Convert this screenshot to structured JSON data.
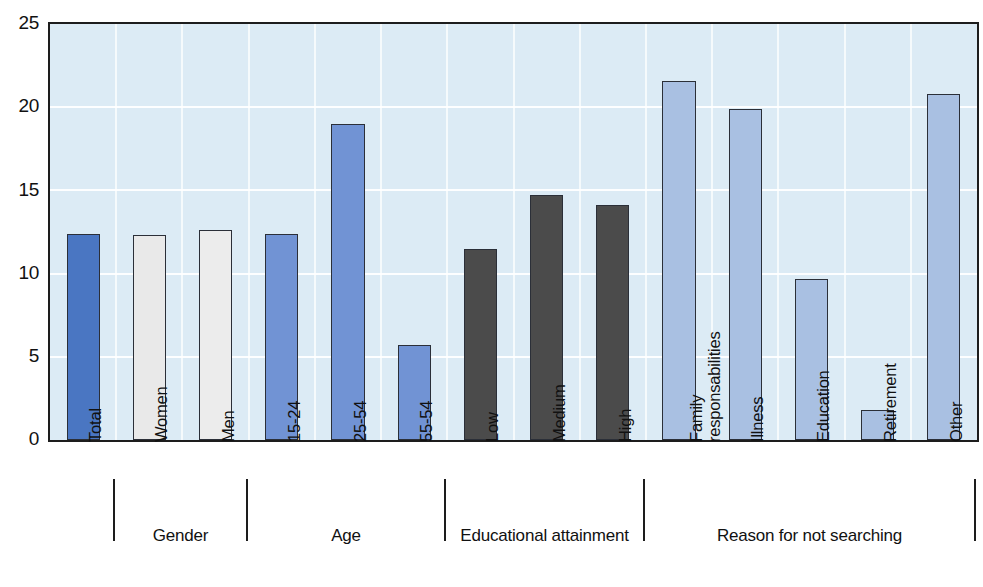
{
  "chart_data": {
    "type": "bar",
    "title": "",
    "subtitle": "",
    "xlabel": "",
    "ylabel": "",
    "ylim": [
      0,
      25
    ],
    "ytick_values": [
      0,
      5,
      10,
      15,
      20,
      25
    ],
    "ytick_labels": [
      "0",
      "5",
      "10",
      "15",
      "20",
      "25"
    ],
    "grid": "horizontal-and-vertical-white",
    "legend": "none",
    "categories": [
      "Total",
      "Women",
      "Men",
      "15-24",
      "25-54",
      "55-54",
      "Low",
      "Medium",
      "High",
      "Family responsabilities",
      "Illness",
      "Education",
      "Retirement",
      "Other"
    ],
    "values": [
      12.4,
      12.3,
      12.6,
      12.4,
      19.0,
      5.7,
      11.5,
      14.7,
      14.1,
      21.6,
      19.9,
      9.7,
      1.8,
      20.8
    ],
    "bar_colors": [
      "#4a76c2",
      "#e9e9e9",
      "#ececec",
      "#7193d4",
      "#7193d4",
      "#7193d4",
      "#4b4b4b",
      "#4b4b4b",
      "#4b4b4b",
      "#a9c0e2",
      "#a9c0e2",
      "#a9c0e2",
      "#a9c0e2",
      "#a9c0e2"
    ],
    "groups": [
      {
        "name": "Gender",
        "first_index": 1,
        "last_index": 2
      },
      {
        "name": "Age",
        "first_index": 3,
        "last_index": 5
      },
      {
        "name": "Educational attainment",
        "first_index": 6,
        "last_index": 8
      },
      {
        "name": "Reason for not searching",
        "first_index": 9,
        "last_index": 13
      }
    ],
    "plot_background": "#dcebf5",
    "gridline_color": "#ffffff",
    "axis_color": "#1d1d1d"
  },
  "labels": {
    "tick_labels": {
      "t0": "0",
      "t5": "5",
      "t10": "10",
      "t15": "15",
      "t20": "20",
      "t25": "25"
    },
    "categories": {
      "c0": "Total",
      "c1": "Women",
      "c2": "Men",
      "c3": "15-24",
      "c4": "25-54",
      "c5": "55-54",
      "c6": "Low",
      "c7": "Medium",
      "c8": "High",
      "c9_line1": "Family",
      "c9_line2": "responsabilities",
      "c10": "Illness",
      "c11": "Education",
      "c12": "Retirement",
      "c13": "Other"
    },
    "groups": {
      "g0": "Gender",
      "g1": "Age",
      "g2": "Educational attainment",
      "g3": "Reason for not searching"
    }
  }
}
